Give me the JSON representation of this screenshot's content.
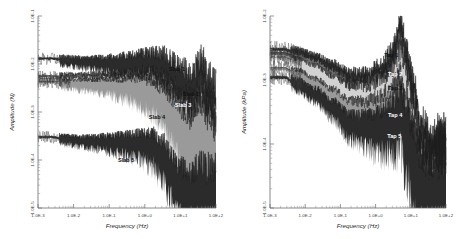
{
  "figure": {
    "panels": [
      "left",
      "right"
    ],
    "background": "#ffffff"
  },
  "chart_data": [
    {
      "id": "left",
      "type": "line",
      "title": "",
      "xlabel": "Frequency (Hz)",
      "ylabel": "Amplitude (N)",
      "xscale": "log",
      "yscale": "log",
      "xlim": [
        0.001,
        100
      ],
      "ylim": [
        1e-05,
        0.1
      ],
      "xticklabels": [
        "1.0E-3",
        "1.0E-2",
        "1.0E-1",
        "1.0E+0",
        "1.0E+1",
        "1.0E+2"
      ],
      "yticklabels": [
        "1.0E-1",
        "1.0E-2",
        "1.0E-3",
        "1.0E-4",
        "1.0E-5"
      ],
      "grid": false,
      "legend": "inline-annotations",
      "annotations": [
        {
          "text": "Slab 1",
          "x": 8.0,
          "y": 0.007
        },
        {
          "text": "Slab 2",
          "x": 20.0,
          "y": 0.0022
        },
        {
          "text": "Slab 3",
          "x": 12.0,
          "y": 0.0013
        },
        {
          "text": "Slab 4",
          "x": 2.2,
          "y": 0.0007
        },
        {
          "text": "Slab 5",
          "x": 0.3,
          "y": 9e-05
        }
      ],
      "series": [
        {
          "name": "Slab 1",
          "shade": "#2b2b2b",
          "x": [
            0.0025,
            0.006,
            0.02,
            0.06,
            0.2,
            0.6,
            1.5,
            3.0,
            6.0,
            10.0,
            20.0,
            40.0,
            60.0,
            100.0
          ],
          "values": [
            0.013,
            0.012,
            0.011,
            0.0105,
            0.01,
            0.0095,
            0.009,
            0.0075,
            0.005,
            0.0032,
            0.002,
            0.003,
            0.0012,
            0.0006
          ]
        },
        {
          "name": "Slab 2",
          "shade": "#6d6d6d",
          "x": [
            0.0025,
            0.006,
            0.02,
            0.06,
            0.2,
            0.6,
            1.5,
            3.0,
            6.0,
            10.0,
            20.0,
            40.0,
            60.0,
            100.0
          ],
          "values": [
            0.0055,
            0.0052,
            0.005,
            0.0048,
            0.0046,
            0.0043,
            0.0038,
            0.0028,
            0.0016,
            0.0009,
            0.00055,
            0.0009,
            0.0004,
            0.0002
          ]
        },
        {
          "name": "Slab 3",
          "shade": "#d2d2d2",
          "x": [
            0.0025,
            0.006,
            0.02,
            0.06,
            0.2,
            0.6,
            1.5,
            3.0,
            6.0,
            10.0,
            20.0,
            40.0,
            60.0,
            100.0
          ],
          "values": [
            0.0048,
            0.0046,
            0.0044,
            0.0042,
            0.004,
            0.0037,
            0.0031,
            0.0021,
            0.0011,
            0.0006,
            0.00035,
            0.0006,
            0.00026,
            0.00013
          ]
        },
        {
          "name": "Slab 4",
          "shade": "#9a9a9a",
          "x": [
            0.0025,
            0.006,
            0.02,
            0.06,
            0.2,
            0.6,
            1.5,
            3.0,
            6.0,
            10.0,
            20.0,
            40.0,
            60.0,
            100.0
          ],
          "values": [
            0.0042,
            0.004,
            0.0038,
            0.0036,
            0.0034,
            0.0031,
            0.0025,
            0.0016,
            0.0008,
            0.0004,
            0.00023,
            0.0004,
            0.00017,
            9e-05
          ]
        },
        {
          "name": "Slab 5",
          "shade": "#2b2b2b",
          "x": [
            0.0025,
            0.006,
            0.02,
            0.06,
            0.2,
            0.6,
            1.5,
            3.0,
            6.0,
            10.0,
            20.0,
            40.0,
            60.0,
            100.0
          ],
          "values": [
            0.0003,
            0.00027,
            0.00025,
            0.00024,
            0.00023,
            0.00022,
            0.00019,
            0.00012,
            5e-05,
            2.4e-05,
            1.5e-05,
            2.2e-05,
            1.4e-05,
            1.2e-05
          ]
        }
      ]
    },
    {
      "id": "right",
      "type": "line",
      "title": "",
      "xlabel": "Frequency (Hz)",
      "ylabel": "Amplitude (kPa)",
      "xscale": "log",
      "yscale": "log",
      "xlim": [
        0.001,
        100
      ],
      "ylim": [
        1e-05,
        0.01
      ],
      "xticklabels": [
        "1.0E-3",
        "1.0E-2",
        "1.0E-1",
        "1.0E+0",
        "1.0E+1",
        "1.0E+2"
      ],
      "yticklabels": [
        "1.0E-2",
        "1.0E-3",
        "1.0E-4",
        "1.0E-5"
      ],
      "grid": false,
      "legend": "inline-annotations",
      "annotations": [
        {
          "text": "Tap 1",
          "x": 2.8,
          "y": 0.0023
        },
        {
          "text": "Tap 2",
          "x": 3.6,
          "y": 0.00115
        },
        {
          "text": "Tap 3",
          "x": 3.6,
          "y": 0.0007
        },
        {
          "text": "Tap 4",
          "x": 3.6,
          "y": 0.00026
        },
        {
          "text": "Tap 5",
          "x": 3.4,
          "y": 0.000125
        }
      ],
      "series": [
        {
          "name": "Tap 1",
          "shade": "#2b2b2b",
          "x": [
            0.0025,
            0.006,
            0.02,
            0.06,
            0.2,
            0.6,
            1.5,
            3.0,
            5.0,
            7.0,
            12.0,
            20.0,
            40.0,
            100.0
          ],
          "values": [
            0.003,
            0.0026,
            0.002,
            0.0014,
            0.0009,
            0.0008,
            0.0009,
            0.0013,
            0.0045,
            0.0015,
            0.0003,
            6e-05,
            3e-05,
            2.6e-05
          ]
        },
        {
          "name": "Tap 2",
          "shade": "#6d6d6d",
          "x": [
            0.0025,
            0.006,
            0.02,
            0.06,
            0.2,
            0.6,
            1.5,
            3.0,
            5.0,
            7.0,
            12.0,
            20.0,
            40.0,
            100.0
          ],
          "values": [
            0.0026,
            0.0022,
            0.0017,
            0.00115,
            0.00072,
            0.00064,
            0.0007,
            0.001,
            0.0022,
            0.0009,
            0.0002,
            4.5e-05,
            2.4e-05,
            2.1e-05
          ]
        },
        {
          "name": "Tap 3",
          "shade": "#d2d2d2",
          "x": [
            0.0025,
            0.006,
            0.02,
            0.06,
            0.2,
            0.6,
            1.5,
            3.0,
            5.0,
            7.0,
            12.0,
            20.0,
            40.0,
            100.0
          ],
          "values": [
            0.0022,
            0.0018,
            0.00135,
            0.0009,
            0.00056,
            0.0005,
            0.00054,
            0.00075,
            0.0013,
            0.0006,
            0.00014,
            3.4e-05,
            1.9e-05,
            1.7e-05
          ]
        },
        {
          "name": "Tap 4",
          "shade": "#9a9a9a",
          "x": [
            0.0025,
            0.006,
            0.02,
            0.06,
            0.2,
            0.6,
            1.5,
            3.0,
            5.0,
            7.0,
            12.0,
            20.0,
            40.0,
            100.0
          ],
          "values": [
            0.0015,
            0.0012,
            0.00085,
            0.00054,
            0.00032,
            0.00028,
            0.0003,
            0.00036,
            0.0005,
            0.00026,
            8e-05,
            2.4e-05,
            1.5e-05,
            1.4e-05
          ]
        },
        {
          "name": "Tap 5",
          "shade": "#2b2b2b",
          "x": [
            0.0025,
            0.006,
            0.02,
            0.06,
            0.2,
            0.6,
            1.5,
            3.0,
            5.0,
            7.0,
            12.0,
            20.0,
            40.0,
            100.0
          ],
          "values": [
            0.0011,
            0.00085,
            0.0006,
            0.00036,
            0.0002,
            0.00017,
            0.00018,
            0.00021,
            0.00028,
            0.00016,
            5.5e-05,
            1.8e-05,
            1.2e-05,
            1.1e-05
          ]
        }
      ]
    }
  ]
}
